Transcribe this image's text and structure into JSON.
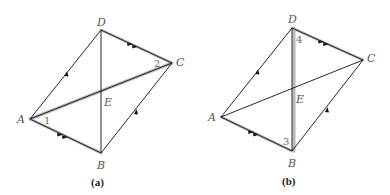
{
  "figures": [
    {
      "id": "a",
      "caption": "(a)",
      "points": {
        "A": {
          "label": "A",
          "x": 30,
          "y": 119
        },
        "B": {
          "label": "B",
          "x": 101,
          "y": 153
        },
        "C": {
          "label": "C",
          "x": 172,
          "y": 63
        },
        "D": {
          "label": "D",
          "x": 101,
          "y": 30
        },
        "E": {
          "label": "E",
          "x": 101,
          "y": 91
        }
      },
      "angle_labels": [
        {
          "text": "1",
          "at": "A"
        },
        {
          "text": "2",
          "at": "C"
        }
      ],
      "highlighted_segments": [
        "AB",
        "DC",
        "AC"
      ],
      "arrows": {
        "single": [
          "AD",
          "BC"
        ],
        "double": [
          "AB",
          "DC"
        ]
      }
    },
    {
      "id": "b",
      "caption": "(b)",
      "points": {
        "A": {
          "label": "A",
          "x": 221,
          "y": 117
        },
        "B": {
          "label": "B",
          "x": 292,
          "y": 151
        },
        "C": {
          "label": "C",
          "x": 363,
          "y": 60
        },
        "D": {
          "label": "D",
          "x": 292,
          "y": 28
        },
        "E": {
          "label": "E",
          "x": 292,
          "y": 89
        }
      },
      "angle_labels": [
        {
          "text": "4",
          "at": "D"
        },
        {
          "text": "3",
          "at": "B"
        }
      ],
      "highlighted_segments": [
        "AB",
        "DC",
        "DB"
      ],
      "arrows": {
        "single": [
          "AD",
          "BC"
        ],
        "double": [
          "AB",
          "DC"
        ]
      }
    }
  ]
}
